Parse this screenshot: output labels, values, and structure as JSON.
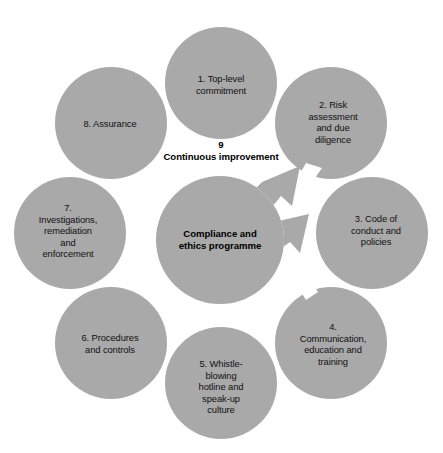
{
  "diagram": {
    "type": "cycle-diagram",
    "colors": {
      "node_fill": "#a9a9a9",
      "center_fill": "#a9a9a9",
      "arrow_fill": "#a9a9a9",
      "background": "#ffffff",
      "text": "#111111"
    },
    "center": {
      "label": "Compliance and\nethics programme"
    },
    "cycle": {
      "number": "9",
      "label": "Continuous improvement",
      "full": "9\nContinuous improvement"
    },
    "nodes": [
      {
        "number": "1",
        "label": "1. Top-level\ncommitment",
        "cx": 221,
        "cy": 83,
        "r": 56,
        "label_x": 221,
        "label_y": 85
      },
      {
        "number": "2",
        "label": "2. Risk\nassessment\nand due\ndiligence",
        "cx": 331,
        "cy": 123,
        "r": 56,
        "label_x": 333,
        "label_y": 122
      },
      {
        "number": "3",
        "label": "3. Code of\nconduct and\npolicies",
        "cx": 372,
        "cy": 233,
        "r": 56,
        "label_x": 376,
        "label_y": 230
      },
      {
        "number": "4",
        "label": "4.\nCommunication,\neducation and\ntraining",
        "cx": 331,
        "cy": 343,
        "r": 56,
        "label_x": 333,
        "label_y": 344
      },
      {
        "number": "5",
        "label": "5. Whistle-\nblowing\nhotline and\nspeak-up\nculture",
        "cx": 221,
        "cy": 383,
        "r": 56,
        "label_x": 221,
        "label_y": 387
      },
      {
        "number": "6",
        "label": "6. Procedures\nand controls",
        "cx": 111,
        "cy": 343,
        "r": 56,
        "label_x": 110,
        "label_y": 344
      },
      {
        "number": "7",
        "label": "7.\nInvestigations,\nremediation\nand\nenforcement",
        "cx": 70,
        "cy": 233,
        "r": 56,
        "label_x": 68,
        "label_y": 231
      },
      {
        "number": "8",
        "label": "8. Assurance",
        "cx": 111,
        "cy": 123,
        "r": 56,
        "label_x": 110,
        "label_y": 124
      }
    ]
  }
}
